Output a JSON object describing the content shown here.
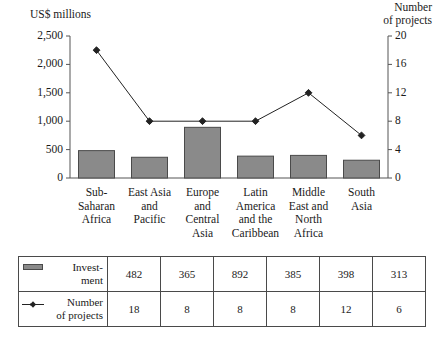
{
  "chart_data": {
    "type": "bar",
    "title": "",
    "subtitle": "",
    "categories": [
      "Sub-\nSaharan\nAfrica",
      "East Asia\nand\nPacific",
      "Europe\nand\nCentral\nAsia",
      "Latin\nAmerica\nand the\nCaribbean",
      "Middle\nEast and\nNorth\nAfrica",
      "South\nAsia"
    ],
    "series": [
      {
        "name": "Investment",
        "type": "bar",
        "axis": "left",
        "values": [
          482,
          365,
          892,
          385,
          398,
          313
        ],
        "color": "#8a8a8a",
        "edge_color": "#4a4a4a"
      },
      {
        "name": "Number of projects",
        "type": "line",
        "axis": "right",
        "values": [
          18,
          8,
          8,
          8,
          12,
          6
        ],
        "color": "#222222",
        "marker": "diamond"
      }
    ],
    "xlabel": "",
    "ylabel": "US$ millions",
    "y2label": "Number of projects",
    "ylim": [
      0,
      2500
    ],
    "y2lim": [
      0,
      20
    ],
    "yticks": [
      0,
      500,
      1000,
      1500,
      2000,
      2500
    ],
    "y2ticks": [
      0,
      4,
      8,
      12,
      16,
      20
    ],
    "ytick_labels": [
      "0",
      "500",
      "1,000",
      "1,500",
      "2,000",
      "2,500"
    ],
    "y2tick_labels": [
      "0",
      "4",
      "8",
      "12",
      "16",
      "20"
    ],
    "grid": false,
    "legend_position": "table-below"
  },
  "axes": {
    "left_title": "US$ millions",
    "right_title": "Number\nof projects"
  },
  "table": {
    "rows": [
      {
        "label": "Invest-\nment",
        "marker": "bar-swatch",
        "values": [
          "482",
          "365",
          "892",
          "385",
          "398",
          "313"
        ]
      },
      {
        "label": "Number\nof projects",
        "marker": "line-swatch",
        "values": [
          "18",
          "8",
          "8",
          "8",
          "12",
          "6"
        ]
      }
    ]
  },
  "colors": {
    "bar_fill": "#8a8a8a",
    "bar_edge": "#4a4a4a",
    "line": "#222222",
    "axis": "#555555",
    "text": "#1a1a1a",
    "table_border": "#4a4a4a",
    "background": "#ffffff"
  }
}
